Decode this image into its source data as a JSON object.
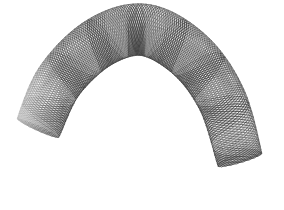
{
  "image": {
    "subject": "curved braided wire mesh stent",
    "background_color": "#ffffff",
    "wire_color": "#3a3a3a",
    "fade_end": "left",
    "centerline": [
      [
        38,
        128
      ],
      [
        60,
        80
      ],
      [
        100,
        42
      ],
      [
        145,
        30
      ],
      [
        190,
        55
      ],
      [
        222,
        100
      ],
      [
        240,
        160
      ]
    ],
    "tube_radius": 24,
    "helix_count": 22
  }
}
